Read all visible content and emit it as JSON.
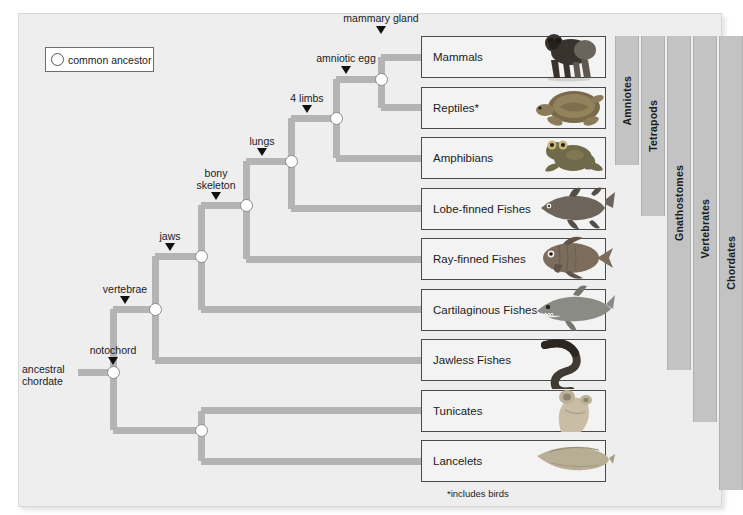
{
  "figure": {
    "footnote": "*includes birds",
    "branch_color": "#b4b4b4",
    "band_color": "#c3c3c3",
    "panel_color": "#eeeeee"
  },
  "legend": {
    "label": "common ancestor",
    "icon": "open-circle-icon"
  },
  "root_label": {
    "line1": "ancestral",
    "line2": "chordate"
  },
  "characters": [
    {
      "name": "notochord",
      "x": 113,
      "y": 372
    },
    {
      "name": "vertebrae",
      "x": 155,
      "y": 309
    },
    {
      "name": "jaws",
      "x": 201,
      "y": 256
    },
    {
      "name": "bony skeleton",
      "x": 246,
      "y": 205
    },
    {
      "name": "lungs",
      "x": 291,
      "y": 161
    },
    {
      "name": "4 limbs",
      "x": 336,
      "y": 118
    },
    {
      "name": "amniotic egg",
      "x": 381,
      "y": 79
    },
    {
      "name": "mammary gland",
      "x": 381,
      "y": 57
    }
  ],
  "taxa": [
    {
      "label": "Mammals",
      "organism": "gorilla-image"
    },
    {
      "label": "Reptiles*",
      "organism": "turtle-image"
    },
    {
      "label": "Amphibians",
      "organism": "frog-image"
    },
    {
      "label": "Lobe-finned Fishes",
      "organism": "coelacanth-image"
    },
    {
      "label": "Ray-finned Fishes",
      "organism": "ray-finned-fish-image"
    },
    {
      "label": "Cartilaginous Fishes",
      "organism": "shark-image"
    },
    {
      "label": "Jawless Fishes",
      "organism": "lamprey-image"
    },
    {
      "label": "Tunicates",
      "organism": "tunicate-image"
    },
    {
      "label": "Lancelets",
      "organism": "lancelet-image"
    }
  ],
  "groups": [
    {
      "label": "Amniotes",
      "x": 615,
      "y": 36,
      "w": 24,
      "h": 129
    },
    {
      "label": "Tetrapods",
      "x": 641,
      "y": 36,
      "w": 24,
      "h": 180
    },
    {
      "label": "Gnathostomes",
      "x": 667,
      "y": 36,
      "w": 24,
      "h": 334
    },
    {
      "label": "Vertebrates",
      "x": 693,
      "y": 36,
      "w": 24,
      "h": 386
    },
    {
      "label": "Chordates",
      "x": 719,
      "y": 36,
      "w": 24,
      "h": 454
    }
  ]
}
